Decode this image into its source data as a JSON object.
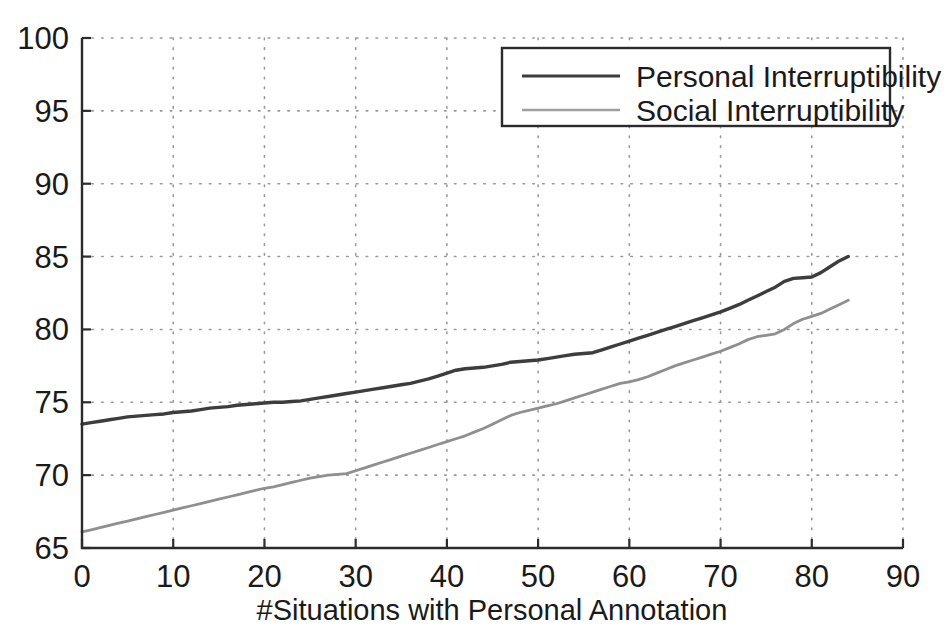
{
  "chart_data": {
    "type": "line",
    "title": "",
    "xlabel": "#Situations with Personal Annotation",
    "ylabel": "",
    "xlim": [
      0,
      90
    ],
    "ylim": [
      65,
      100
    ],
    "xticks": [
      0,
      10,
      20,
      30,
      40,
      50,
      60,
      70,
      80,
      90
    ],
    "yticks": [
      65,
      70,
      75,
      80,
      85,
      90,
      95,
      100
    ],
    "grid": true,
    "legend_position": "top-right",
    "series": [
      {
        "name": "Personal Interruptibility",
        "color": "#3d3d3d",
        "width": 3.4,
        "x": [
          0,
          1,
          2,
          3,
          4,
          5,
          6,
          7,
          8,
          9,
          10,
          11,
          12,
          13,
          14,
          15,
          16,
          17,
          18,
          19,
          20,
          21,
          22,
          23,
          24,
          25,
          26,
          27,
          28,
          29,
          30,
          31,
          32,
          33,
          34,
          35,
          36,
          37,
          38,
          39,
          40,
          41,
          42,
          43,
          44,
          45,
          46,
          47,
          48,
          49,
          50,
          51,
          52,
          53,
          54,
          55,
          56,
          57,
          58,
          59,
          60,
          61,
          62,
          63,
          64,
          65,
          66,
          67,
          68,
          69,
          70,
          71,
          72,
          73,
          74,
          75,
          76,
          77,
          78,
          79,
          80,
          81,
          82,
          83,
          84
        ],
        "values": [
          73.5,
          73.6,
          73.7,
          73.8,
          73.9,
          74.0,
          74.05,
          74.1,
          74.15,
          74.2,
          74.3,
          74.35,
          74.4,
          74.5,
          74.6,
          74.65,
          74.7,
          74.8,
          74.85,
          74.9,
          74.95,
          75.0,
          75.0,
          75.05,
          75.1,
          75.2,
          75.3,
          75.4,
          75.5,
          75.6,
          75.7,
          75.8,
          75.9,
          76.0,
          76.1,
          76.2,
          76.3,
          76.45,
          76.6,
          76.8,
          77.0,
          77.2,
          77.3,
          77.35,
          77.4,
          77.5,
          77.6,
          77.75,
          77.8,
          77.85,
          77.9,
          78.0,
          78.1,
          78.2,
          78.3,
          78.35,
          78.4,
          78.6,
          78.8,
          79.0,
          79.2,
          79.4,
          79.6,
          79.8,
          80.0,
          80.2,
          80.4,
          80.6,
          80.8,
          81.0,
          81.2,
          81.45,
          81.7,
          82.0,
          82.3,
          82.6,
          82.9,
          83.3,
          83.5,
          83.55,
          83.6,
          83.9,
          84.3,
          84.7,
          85.0
        ]
      },
      {
        "name": "Social Interruptibility",
        "color": "#8f8f8f",
        "width": 2.8,
        "x": [
          0,
          1,
          2,
          3,
          4,
          5,
          6,
          7,
          8,
          9,
          10,
          11,
          12,
          13,
          14,
          15,
          16,
          17,
          18,
          19,
          20,
          21,
          22,
          23,
          24,
          25,
          26,
          27,
          28,
          29,
          30,
          31,
          32,
          33,
          34,
          35,
          36,
          37,
          38,
          39,
          40,
          41,
          42,
          43,
          44,
          45,
          46,
          47,
          48,
          49,
          50,
          51,
          52,
          53,
          54,
          55,
          56,
          57,
          58,
          59,
          60,
          61,
          62,
          63,
          64,
          65,
          66,
          67,
          68,
          69,
          70,
          71,
          72,
          73,
          74,
          75,
          76,
          77,
          78,
          79,
          80,
          81,
          82,
          83,
          84
        ],
        "values": [
          66.1,
          66.25,
          66.4,
          66.55,
          66.7,
          66.85,
          67.0,
          67.15,
          67.3,
          67.45,
          67.6,
          67.75,
          67.9,
          68.05,
          68.2,
          68.35,
          68.5,
          68.65,
          68.8,
          68.95,
          69.1,
          69.2,
          69.35,
          69.5,
          69.65,
          69.8,
          69.9,
          70.0,
          70.05,
          70.1,
          70.3,
          70.5,
          70.7,
          70.9,
          71.1,
          71.3,
          71.5,
          71.7,
          71.9,
          72.1,
          72.3,
          72.5,
          72.7,
          72.95,
          73.2,
          73.5,
          73.8,
          74.1,
          74.3,
          74.45,
          74.6,
          74.75,
          74.9,
          75.1,
          75.3,
          75.5,
          75.7,
          75.9,
          76.1,
          76.3,
          76.4,
          76.55,
          76.75,
          77.0,
          77.25,
          77.5,
          77.7,
          77.9,
          78.1,
          78.3,
          78.5,
          78.75,
          79.0,
          79.3,
          79.5,
          79.6,
          79.7,
          80.0,
          80.4,
          80.7,
          80.9,
          81.1,
          81.4,
          81.7,
          82.0
        ]
      }
    ]
  },
  "legend": {
    "entries": [
      {
        "label": "Personal Interruptibility"
      },
      {
        "label": "Social Interruptibility"
      }
    ]
  },
  "axes": {
    "x_tick_labels": [
      "0",
      "10",
      "20",
      "30",
      "40",
      "50",
      "60",
      "70",
      "80",
      "90"
    ],
    "y_tick_labels": [
      "65",
      "70",
      "75",
      "80",
      "85",
      "90",
      "95",
      "100"
    ],
    "x_axis_title": "#Situations with Personal Annotation"
  },
  "colors": {
    "personal": "#3d3d3d",
    "social": "#8f8f8f",
    "axis": "#2b2b2b",
    "grid": "#9a9a9a",
    "background": "#ffffff"
  }
}
